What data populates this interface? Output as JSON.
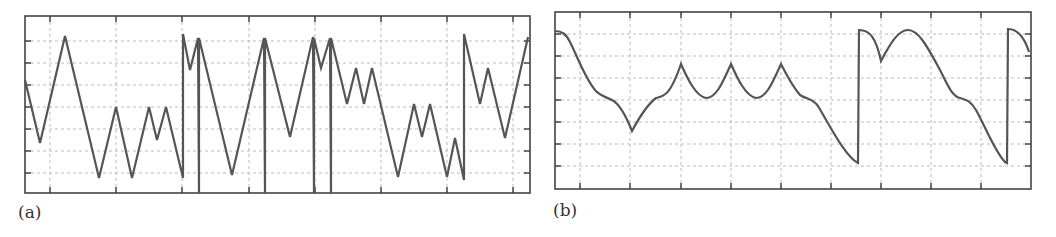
{
  "labels": {
    "a": "(a)",
    "b": "(b)"
  },
  "colors": {
    "line": "#555555",
    "frame": "#444444",
    "grid": "#bbbbbb"
  },
  "chart_data": [
    {
      "panel": "(a)",
      "type": "line",
      "title": "",
      "xlabel": "",
      "ylabel": "",
      "grid": true,
      "legend": null,
      "description": "Piecewise-linear zigzag signal with abrupt vertical jumps, values normalized 0-8 (gridlines at 1..7)",
      "frame_px": {
        "left": 25,
        "top": 16,
        "right": 530,
        "bottom": 193
      },
      "grid_x_px": [
        50,
        116,
        182,
        249,
        315,
        381,
        447,
        513
      ],
      "grid_y_px": [
        41,
        63,
        85,
        107,
        129,
        151,
        173
      ],
      "ylim": [
        0,
        8
      ],
      "points_px": [
        [
          25,
          80
        ],
        [
          40,
          143
        ],
        [
          65,
          36
        ],
        [
          99,
          178
        ],
        [
          116,
          107
        ],
        [
          132,
          178
        ],
        [
          149,
          107
        ],
        [
          157,
          140
        ],
        [
          166,
          107
        ],
        [
          183,
          178
        ],
        [
          183,
          34
        ],
        [
          190,
          70
        ],
        [
          198,
          38
        ],
        [
          199,
          193
        ],
        [
          199,
          38
        ],
        [
          232,
          175
        ],
        [
          264,
          38
        ],
        [
          265,
          193
        ],
        [
          265,
          38
        ],
        [
          290,
          137
        ],
        [
          313,
          37
        ],
        [
          314,
          193
        ],
        [
          314,
          38
        ],
        [
          321,
          68
        ],
        [
          330,
          38
        ],
        [
          331,
          193
        ],
        [
          331,
          38
        ],
        [
          347,
          104
        ],
        [
          356,
          68
        ],
        [
          364,
          104
        ],
        [
          372,
          68
        ],
        [
          398,
          177
        ],
        [
          414,
          104
        ],
        [
          422,
          137
        ],
        [
          430,
          104
        ],
        [
          447,
          177
        ],
        [
          455,
          138
        ],
        [
          464,
          180
        ],
        [
          464,
          34
        ],
        [
          480,
          104
        ],
        [
          488,
          68
        ],
        [
          505,
          138
        ],
        [
          528,
          37
        ]
      ]
    },
    {
      "panel": "(b)",
      "type": "line",
      "title": "",
      "xlabel": "",
      "ylabel": "",
      "grid": true,
      "legend": null,
      "description": "Smooth periodic signal with cusps and sawtooth-like drops/jumps, values normalized 0-8 (gridlines at 1..7)",
      "frame_px": {
        "left": 555,
        "top": 12,
        "right": 1031,
        "bottom": 189
      },
      "grid_x_px": [
        580,
        630,
        681,
        731,
        781,
        831,
        881,
        931,
        981
      ],
      "grid_y_px": [
        34,
        56,
        78,
        100,
        122,
        144,
        166
      ],
      "ylim": [
        0,
        8
      ],
      "path_d": "M555,31 C562,31 566,34 570,42 C578,58 585,78 595,90 C600,96 606,97 612,100 C620,104 626,116 632,131 C640,116 648,104 656,98 C664,96 670,96 681,64 C688,80 696,96 706,98 C716,98 722,84 731,64 C738,80 746,96 756,98 C766,98 772,84 781,64 C788,78 794,88 800,95 C808,100 812,98 818,106 C830,126 845,156 858,163 L859,30 C870,30 876,38 881,61 C890,44 898,30 908,30 C918,30 926,44 940,70 C948,86 952,96 960,98 C966,100 970,100 976,110 C986,128 995,152 1005,162 L1007,163 L1008,29 C1016,29 1024,36 1029,52",
      "key_points_px": [
        [
          555,
          31
        ],
        [
          632,
          131
        ],
        [
          681,
          64
        ],
        [
          706,
          98
        ],
        [
          731,
          64
        ],
        [
          756,
          98
        ],
        [
          781,
          64
        ],
        [
          858,
          163
        ],
        [
          859,
          30
        ],
        [
          881,
          61
        ],
        [
          908,
          30
        ],
        [
          1005,
          162
        ],
        [
          1008,
          29
        ],
        [
          1029,
          52
        ]
      ]
    }
  ]
}
